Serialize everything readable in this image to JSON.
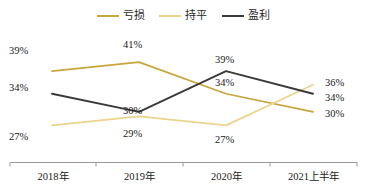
{
  "chart_data": {
    "type": "line",
    "title": "",
    "xlabel": "",
    "ylabel": "",
    "categories": [
      "2018年",
      "2019年",
      "2020年",
      "2021上半年"
    ],
    "series": [
      {
        "name": "亏损",
        "color": "#C9A63C",
        "values": [
          39,
          41,
          34,
          30
        ],
        "labels": [
          "39%",
          "41%",
          "34%",
          "30%"
        ]
      },
      {
        "name": "持平",
        "color": "#EBD48C",
        "values": [
          27,
          29,
          27,
          36
        ],
        "labels": [
          "27%",
          "29%",
          "27%",
          "36%"
        ]
      },
      {
        "name": "盈利",
        "color": "#3A3A3A",
        "values": [
          34,
          30,
          39,
          34
        ],
        "labels": [
          "34%",
          "30%",
          "39%",
          "34%"
        ]
      }
    ],
    "ylim": [
      22,
      45
    ],
    "grid": false,
    "legend_position": "top-center",
    "axis_color": "#9a9a9a"
  },
  "legend": {
    "items": [
      {
        "label": "亏损",
        "color": "#C9A63C"
      },
      {
        "label": "持平",
        "color": "#EBD48C"
      },
      {
        "label": "盈利",
        "color": "#3A3A3A"
      }
    ]
  },
  "axis": {
    "ticks": [
      "2018年",
      "2019年",
      "2020年",
      "2021上半年"
    ]
  },
  "data_labels": {
    "kuisun": {
      "y2018": "39%",
      "y2019": "41%",
      "y2020": "34%",
      "y2021": "30%"
    },
    "chiping": {
      "y2018": "27%",
      "y2019": "29%",
      "y2020": "27%",
      "y2021": "36%"
    },
    "yingli": {
      "y2018": "34%",
      "y2019": "30%",
      "y2020": "39%",
      "y2021": "34%"
    }
  }
}
